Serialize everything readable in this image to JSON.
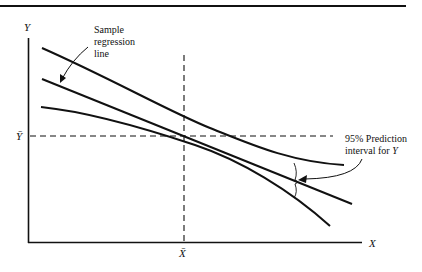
{
  "diagram": {
    "axes": {
      "y_label": "Y",
      "x_label": "X",
      "y_mean_label": "Ȳ",
      "x_mean_label": "X̄"
    },
    "annotations": {
      "regression_line": [
        "Sample",
        "regression",
        "line"
      ],
      "prediction_interval": [
        "95% Prediction",
        "interval for Y"
      ],
      "prediction_interval_line1": "95% Prediction",
      "prediction_interval_line2_prefix": "interval for ",
      "prediction_interval_line2_var": "Y"
    },
    "curves": [
      {
        "name": "upper-prediction-band",
        "description": "upper 95% prediction limit, narrowest at X̄"
      },
      {
        "name": "sample-regression-line",
        "description": "fitted straight line through (X̄, Ȳ)"
      },
      {
        "name": "lower-prediction-band",
        "description": "lower 95% prediction limit, narrowest at X̄"
      }
    ],
    "reference_lines": [
      {
        "name": "y-mean-line",
        "style": "dashed",
        "at": "Ȳ"
      },
      {
        "name": "x-mean-line",
        "style": "dashed",
        "at": "X̄"
      }
    ],
    "colors": {
      "ink": "#111111",
      "background": "#ffffff"
    }
  }
}
